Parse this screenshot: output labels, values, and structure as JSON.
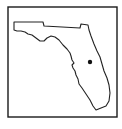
{
  "map": {
    "region": "Florida",
    "frame": {
      "x": 8,
      "y": 7,
      "width": 109,
      "height": 110,
      "stroke": "#1a1a1a"
    },
    "outline": {
      "stroke": "#222222",
      "fill": "#ffffff",
      "points": "14,22 43,22 44,26 80,28 81,24 88,25 89,30 91,36 94,44 97,51 100,57 102,64 104,71 107,78 109,85 110,93 109,101 106,106 101,108 96,110 93,106 90,100 86,94 82,88 79,84 78,79 76,75 75,71 73,68 72,65 74,63 72,60 71,56 70,53 67,49 63,45 59,40 55,37 51,36 47,38 44,41 40,41 36,38 32,35 28,34 25,32 21,31 17,31 14,30"
    },
    "marker": {
      "cx": 90,
      "cy": 62,
      "r": 2.2,
      "color": "#111111"
    }
  }
}
